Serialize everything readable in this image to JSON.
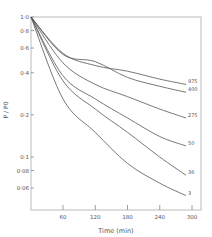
{
  "chart_data": {
    "type": "line",
    "title": "",
    "xlabel": "Time  (min)",
    "ylabel": "P / P0",
    "xlim": [
      0,
      315
    ],
    "ylim": [
      0.045,
      1.0
    ],
    "yscale": "log",
    "grid": false,
    "legend_position": "inline-right",
    "x_ticks": [
      60,
      120,
      180,
      240,
      300
    ],
    "x_tick_labels": [
      "60",
      "120",
      "180",
      "240",
      "300"
    ],
    "y_ticks": [
      1.0,
      0.8,
      0.6,
      0.4,
      0.2,
      0.1,
      0.08,
      0.06
    ],
    "y_tick_labels": [
      "1·0",
      "0·8",
      "0·6",
      "0·4",
      "0·2",
      "0·1",
      "0·08",
      "0·06"
    ],
    "x": [
      0,
      60,
      120,
      180,
      240,
      300
    ],
    "series": [
      {
        "name": "975",
        "values": [
          1.0,
          0.55,
          0.45,
          0.41,
          0.36,
          0.33
        ]
      },
      {
        "name": "400",
        "values": [
          1.0,
          0.54,
          0.48,
          0.37,
          0.32,
          0.29
        ]
      },
      {
        "name": "275",
        "values": [
          1.0,
          0.47,
          0.33,
          0.27,
          0.22,
          0.19
        ]
      },
      {
        "name": "50",
        "values": [
          1.0,
          0.38,
          0.26,
          0.19,
          0.14,
          0.12
        ]
      },
      {
        "name": "36",
        "values": [
          1.0,
          0.35,
          0.22,
          0.15,
          0.1,
          0.074
        ]
      },
      {
        "name": "3",
        "values": [
          1.0,
          0.26,
          0.15,
          0.09,
          0.065,
          0.053
        ]
      }
    ]
  },
  "colors": {
    "line": "#555555",
    "axis": "#888888",
    "text": "#555555"
  }
}
